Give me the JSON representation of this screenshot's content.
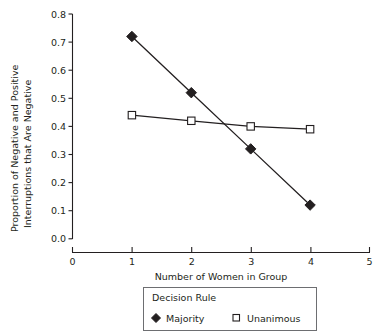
{
  "chart_data": {
    "type": "line",
    "title": "",
    "xlabel": "Number of Women in Group",
    "ylabel": "Proportion of Negative and Positive Interruptions that Are Negative",
    "ylabel_line1": "Proportion of Negative and Positive",
    "ylabel_line2": "Interruptions that Are Negative",
    "x": [
      1,
      2,
      3,
      4
    ],
    "xlim": [
      0,
      5
    ],
    "ylim": [
      0.0,
      0.8
    ],
    "xticks": [
      "0",
      "1",
      "2",
      "3",
      "4",
      "5"
    ],
    "xtick_values": [
      0,
      1,
      2,
      3,
      4,
      5
    ],
    "yticks": [
      "0.0",
      "0.1",
      "0.2",
      "0.3",
      "0.4",
      "0.5",
      "0.6",
      "0.7",
      "0.8"
    ],
    "ytick_values": [
      0.0,
      0.1,
      0.2,
      0.3,
      0.4,
      0.5,
      0.6,
      0.7,
      0.8
    ],
    "grid": false,
    "legend_position": "bottom-center",
    "legend_title": "Decision Rule",
    "series": [
      {
        "name": "Majority",
        "marker": "filled-diamond",
        "color": "#231f20",
        "values": [
          0.72,
          0.52,
          0.32,
          0.12
        ]
      },
      {
        "name": "Unanimous",
        "marker": "open-square",
        "color": "#231f20",
        "values": [
          0.44,
          0.42,
          0.4,
          0.39
        ]
      }
    ]
  },
  "colors": {
    "ink": "#231f20",
    "axis": "#231f20",
    "legend_border": "#6d6e71",
    "background": "#ffffff"
  }
}
